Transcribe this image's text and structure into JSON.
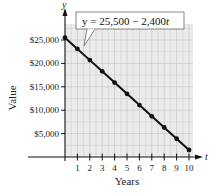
{
  "chart_data": {
    "type": "line",
    "title": "",
    "xlabel": "Years",
    "ylabel": "Value",
    "x_axis_var": "t",
    "y_axis_var": "y",
    "x": [
      0,
      1,
      2,
      3,
      4,
      5,
      6,
      7,
      8,
      9,
      10
    ],
    "series": [
      {
        "name": "y = 25,500 - 2,400t",
        "values": [
          25500,
          23100,
          20700,
          18300,
          15900,
          13500,
          11100,
          8700,
          6300,
          3900,
          1500
        ]
      }
    ],
    "x_ticks": [
      "1",
      "2",
      "3",
      "4",
      "5",
      "6",
      "7",
      "8",
      "9",
      "10"
    ],
    "y_ticks": [
      "$5,000",
      "$10,000",
      "$15,000",
      "$20,000",
      "$25,000"
    ],
    "y_tick_values": [
      5000,
      10000,
      15000,
      20000,
      25000
    ],
    "xlim": [
      0,
      10.3
    ],
    "ylim": [
      0,
      27000
    ],
    "grid": true,
    "annotation": "y = 25,500 − 2,400t",
    "colors": {
      "grid_bg": "#ececec",
      "grid_line": "#c8c8c8",
      "line": "#111111"
    }
  },
  "labels": {
    "equation_prefix": "y = 25,500 − 2,400",
    "equation_var": "t",
    "y_var": "y",
    "x_var": "t",
    "xlabel": "Years",
    "ylabel": "Value",
    "x_ticks": [
      "1",
      "2",
      "3",
      "4",
      "5",
      "6",
      "7",
      "8",
      "9",
      "10"
    ],
    "y_ticks": [
      "$5,000",
      "$10,000",
      "$15,000",
      "$20,000",
      "$25,000"
    ]
  }
}
